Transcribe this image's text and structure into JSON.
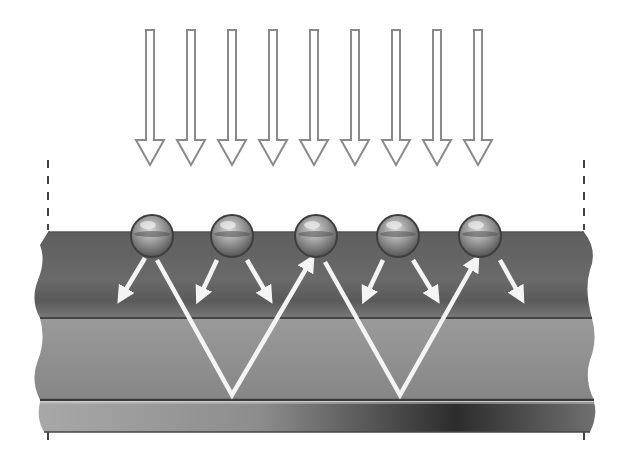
{
  "diagram": {
    "incident_light": {
      "count": 9,
      "x_positions": [
        150,
        191,
        232,
        273,
        314,
        355,
        396,
        437,
        478
      ],
      "y_top": 30,
      "head_y": 140,
      "tip_y": 165,
      "stroke": "#8a8a8a"
    },
    "particles": {
      "count": 5,
      "centers_x": [
        152,
        232,
        316,
        398,
        480
      ],
      "center_y": 236,
      "radius": 21
    },
    "layers": [
      {
        "name": "top-layer",
        "y_top": 232,
        "y_bottom": 318,
        "color": "#6b6b6b"
      },
      {
        "name": "middle-layer",
        "y_top": 318,
        "y_bottom": 400,
        "color": "#8e8e8e"
      },
      {
        "name": "substrate-strip",
        "y_top": 402,
        "y_bottom": 432,
        "gradient": [
          "#a4a4a4",
          "#7a7a7a",
          "#2e2e2e",
          "#6a6a6a"
        ]
      }
    ],
    "boundary_markers": {
      "left_x": 48,
      "right_x": 584,
      "dash_y_top": 160,
      "dash_y_bottom": 230
    },
    "guided_paths": [
      {
        "points": [
          [
            157,
            260
          ],
          [
            232,
            395
          ],
          [
            310,
            262
          ]
        ]
      },
      {
        "points": [
          [
            325,
            262
          ],
          [
            400,
            395
          ],
          [
            475,
            262
          ]
        ]
      }
    ],
    "scatter_arrows": [
      {
        "from": [
          145,
          258
        ],
        "to": [
          122,
          296
        ]
      },
      {
        "from": [
          217,
          260
        ],
        "to": [
          200,
          296
        ]
      },
      {
        "from": [
          247,
          260
        ],
        "to": [
          268,
          296
        ]
      },
      {
        "from": [
          383,
          260
        ],
        "to": [
          366,
          296
        ]
      },
      {
        "from": [
          413,
          260
        ],
        "to": [
          435,
          296
        ]
      },
      {
        "from": [
          500,
          260
        ],
        "to": [
          520,
          296
        ]
      }
    ],
    "colors": {
      "arrow_outline": "#8a8a8a",
      "path_white": "#f4f4f4",
      "layer_line": "#444444"
    }
  }
}
